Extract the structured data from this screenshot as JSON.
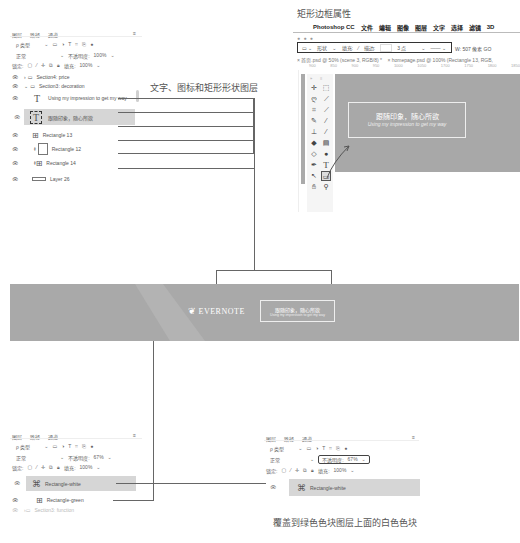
{
  "captions": {
    "rect_props": "矩形边框属性",
    "layers_desc": "文字、图标和矩形形状图层",
    "overlay_desc": "覆盖到绿色色块图层上面的白色色块"
  },
  "layers_panel": {
    "tabs": [
      "图层",
      "路径",
      "通道"
    ],
    "menu_icon": "≡",
    "filter_label": "ρ 类型",
    "filter_icons": [
      "image-filter-icon",
      "adjustment-filter-icon",
      "type-filter-icon",
      "shape-filter-icon",
      "smart-object-filter-icon",
      "toggle-filter-icon"
    ],
    "blend_mode": "正常",
    "opacity_label": "不透明度:",
    "opacity_value": "100%",
    "lock_label": "锁定:",
    "fill_label": "填充:",
    "fill_value": "100%",
    "layers": [
      {
        "name": "Section4: price",
        "type": "group",
        "expanded": false
      },
      {
        "name": "Section3: decoration",
        "type": "group",
        "expanded": true
      },
      {
        "name": "Using my impression to get my way",
        "type": "text"
      },
      {
        "name": "跟随印象，随心所欲",
        "type": "text",
        "selected": true
      },
      {
        "name": "Rectangle 13",
        "type": "shape"
      },
      {
        "name": "Rectangle 12",
        "type": "shape"
      },
      {
        "name": "Rectangle 14",
        "type": "shape"
      },
      {
        "name": "Layer 26",
        "type": "raster"
      }
    ]
  },
  "photoshop": {
    "menubar": [
      "",
      "Photoshop CC",
      "文件",
      "编辑",
      "图像",
      "图层",
      "文字",
      "选择",
      "滤镜",
      "3D"
    ],
    "options": {
      "shape_label": "形状",
      "fill_label": "填充:",
      "stroke_label": "描边:",
      "stroke_width": "3 点",
      "w_label": "W:",
      "w_value": "507 像素",
      "link": "GO"
    },
    "doc_tabs": [
      "首页.psd @ 50% (scene 3, RGB/8) *",
      "homepage.psd @ 100% (Rectangle 13, RGB,"
    ],
    "ruler": [
      "900",
      "850",
      "900",
      "950",
      "1000",
      "1050",
      "1700",
      "1750",
      "1800",
      "1850"
    ],
    "canvas_text_main": "跟随印象，随心所欲",
    "canvas_text_sub": "Using my impression to get my way"
  },
  "banner": {
    "logo": "EVERNOTE",
    "box_main": "跟随印象，随心所欲",
    "box_sub": "Using my impression to get my way"
  },
  "layers_panel_2": {
    "tabs": [
      "图层",
      "路径",
      "通道"
    ],
    "menu_icon": "≡",
    "filter_label": "ρ 类型",
    "blend_mode": "正常",
    "opacity_label": "不透明度:",
    "opacity_value": "67%",
    "lock_label": "锁定:",
    "fill_label": "填充:",
    "fill_value": "100%",
    "layers": [
      {
        "name": "Rectangle-white",
        "type": "shape",
        "selected": true
      },
      {
        "name": "Rectangle-green",
        "type": "shape"
      },
      {
        "name": "Section3: function",
        "type": "group"
      }
    ]
  },
  "layers_panel_3": {
    "tabs": [
      "图层",
      "路径",
      "通道"
    ],
    "menu_icon": "≡",
    "filter_label": "ρ 类型",
    "blend_mode": "正常",
    "opacity_label": "不透明度:",
    "opacity_value": "67%",
    "lock_label": "锁定:",
    "fill_label": "填充:",
    "fill_value": "100%",
    "layers": [
      {
        "name": "Rectangle-white",
        "type": "shape",
        "selected": true
      }
    ]
  }
}
